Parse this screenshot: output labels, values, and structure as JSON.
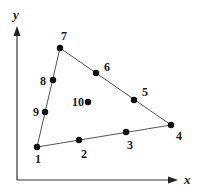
{
  "diagram": {
    "type": "quadrilateral-element-nodes",
    "axes": {
      "x_label": "x",
      "y_label": "y"
    },
    "nodes": [
      {
        "id": "1",
        "label": "1",
        "x": 37,
        "y": 147,
        "lx": 38,
        "ly": 163
      },
      {
        "id": "2",
        "label": "2",
        "x": 79,
        "y": 140,
        "lx": 84,
        "ly": 158
      },
      {
        "id": "3",
        "label": "3",
        "x": 126,
        "y": 132,
        "lx": 130,
        "ly": 149
      },
      {
        "id": "4",
        "label": "4",
        "x": 171,
        "y": 125,
        "lx": 179,
        "ly": 140
      },
      {
        "id": "5",
        "label": "5",
        "x": 134,
        "y": 100,
        "lx": 145,
        "ly": 96
      },
      {
        "id": "6",
        "label": "6",
        "x": 96,
        "y": 73,
        "lx": 107,
        "ly": 71
      },
      {
        "id": "7",
        "label": "7",
        "x": 60,
        "y": 48,
        "lx": 64,
        "ly": 40
      },
      {
        "id": "8",
        "label": "8",
        "x": 53,
        "y": 80,
        "lx": 43,
        "ly": 85
      },
      {
        "id": "9",
        "label": "9",
        "x": 45,
        "y": 112,
        "lx": 36,
        "ly": 116
      },
      {
        "id": "10",
        "label": "10",
        "x": 88,
        "y": 102,
        "lx": 78,
        "ly": 106
      }
    ],
    "edges": [
      [
        "1",
        "4"
      ],
      [
        "4",
        "7"
      ],
      [
        "7",
        "1"
      ]
    ],
    "colors": {
      "line": "#555555",
      "node": "#111111",
      "text": "#1a1a1a"
    }
  }
}
